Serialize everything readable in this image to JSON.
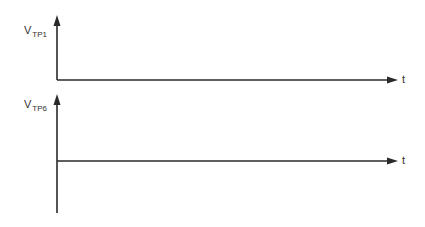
{
  "diagram": {
    "type": "timing-diagram-axes",
    "plots": [
      {
        "y_label_main": "V",
        "y_label_sub": "TP1",
        "x_label": "t"
      },
      {
        "y_label_main": "V",
        "y_label_sub": "TP6",
        "x_label": "t"
      }
    ],
    "colors": {
      "line": "#2a2a2a",
      "background": "#ffffff"
    }
  }
}
